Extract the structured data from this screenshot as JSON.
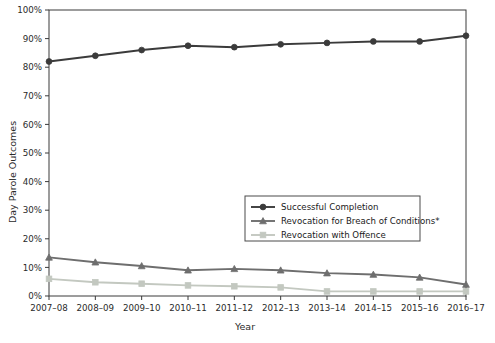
{
  "chart_data": {
    "type": "line",
    "title": "",
    "xlabel": "Year",
    "ylabel": "Day Parole Outcomes",
    "categories": [
      "2007–08",
      "2008–09",
      "2009–10",
      "2010–11",
      "2011–12",
      "2012–13",
      "2013–14",
      "2014–15",
      "2015–16",
      "2016–17"
    ],
    "ylim": [
      0,
      100
    ],
    "ytick_labels": [
      "0%",
      "10%",
      "20%",
      "30%",
      "40%",
      "50%",
      "60%",
      "70%",
      "80%",
      "90%",
      "100%"
    ],
    "ytick_values": [
      0,
      10,
      20,
      30,
      40,
      50,
      60,
      70,
      80,
      90,
      100
    ],
    "grid": false,
    "legend_position": "center-right",
    "series": [
      {
        "name": "Successful Completion",
        "marker": "circle",
        "color": "#3b3b3b",
        "values": [
          82,
          84,
          86,
          87.5,
          87,
          88,
          88.5,
          89,
          89,
          91
        ]
      },
      {
        "name": "Revocation for Breach of Conditions*",
        "marker": "triangle",
        "color": "#6e6e6e",
        "values": [
          13.5,
          11.8,
          10.5,
          9,
          9.5,
          9,
          8,
          7.5,
          6.5,
          4
        ]
      },
      {
        "name": "Revocation with Offence",
        "marker": "square",
        "color": "#c3c8c0",
        "values": [
          6,
          4.8,
          4.3,
          3.7,
          3.4,
          3,
          1.6,
          1.6,
          1.6,
          1.6
        ]
      }
    ]
  },
  "axes": {
    "y_title": "Day Parole Outcomes",
    "x_title": "Year"
  },
  "legend": {
    "entries": [
      {
        "label": "Successful Completion"
      },
      {
        "label": "Revocation for Breach of Conditions*"
      },
      {
        "label": "Revocation with Offence"
      }
    ]
  },
  "colors": {
    "series1": "#3b3b3b",
    "series2": "#6e6e6e",
    "series3": "#c3c8c0",
    "axis": "#2a2a2a",
    "background": "#ffffff"
  }
}
